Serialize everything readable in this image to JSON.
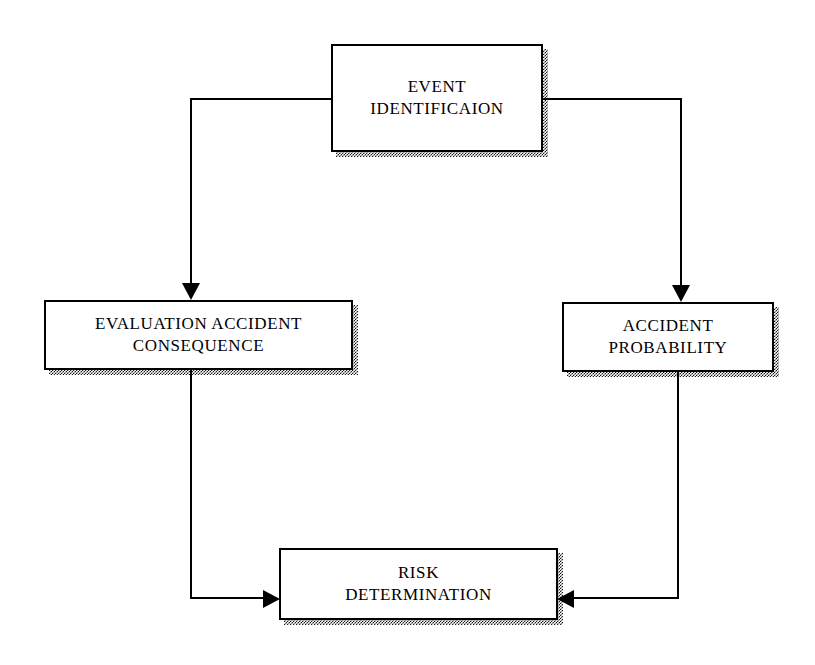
{
  "diagram": {
    "type": "flowchart",
    "title": "",
    "background_color": "#ffffff",
    "line_color": "#000000",
    "box_fill_color": "#ffffff",
    "shadow_style": "checkered-dither",
    "nodes": [
      {
        "id": "event-identification",
        "label": "EVENT\nIDENTIFICAION",
        "line1": "EVENT",
        "line2": "IDENTIFICAION",
        "x": 331,
        "y": 44,
        "width": 212,
        "height": 108
      },
      {
        "id": "evaluation-accident-consequence",
        "label": "EVALUATION ACCIDENT\nCONSEQUENCE",
        "line1": "EVALUATION ACCIDENT",
        "line2": "CONSEQUENCE",
        "x": 44,
        "y": 300,
        "width": 309,
        "height": 70
      },
      {
        "id": "accident-probability",
        "label": "ACCIDENT\nPROBABILITY",
        "line1": "ACCIDENT",
        "line2": "PROBABILITY",
        "x": 562,
        "y": 302,
        "width": 212,
        "height": 70
      },
      {
        "id": "risk-determination",
        "label": "RISK\nDETERMINATION",
        "line1": "RISK",
        "line2": "DETERMINATION",
        "x": 279,
        "y": 548,
        "width": 279,
        "height": 72
      }
    ],
    "edges": [
      {
        "id": "event-to-evaluation",
        "from": "event-identification",
        "to": "evaluation-accident-consequence",
        "arrowhead": "down"
      },
      {
        "id": "event-to-probability",
        "from": "event-identification",
        "to": "accident-probability",
        "arrowhead": "down"
      },
      {
        "id": "evaluation-to-risk",
        "from": "evaluation-accident-consequence",
        "to": "risk-determination",
        "arrowhead": "right"
      },
      {
        "id": "probability-to-risk",
        "from": "accident-probability",
        "to": "risk-determination",
        "arrowhead": "left"
      }
    ]
  }
}
